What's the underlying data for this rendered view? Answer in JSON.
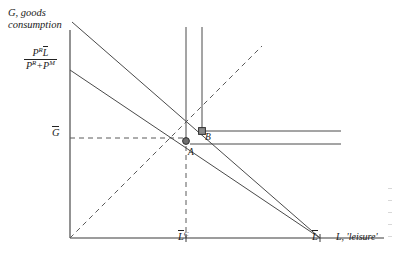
{
  "figure": {
    "type": "economics-diagram",
    "axes": {
      "y_label": "G, goods consumption",
      "y_label_line1": "G, goods",
      "y_label_line2": "consumption",
      "x_label": "L, 'leisure'",
      "origin": {
        "x": 70,
        "y": 238
      },
      "x_axis_end": {
        "x": 384,
        "y": 238
      },
      "y_axis_top": {
        "x": 70,
        "y": 30
      }
    },
    "ticks": {
      "y": [
        {
          "id": "g-bar",
          "label": "G",
          "overbar": true,
          "x": 70,
          "y": 138
        },
        {
          "id": "pr-fraction",
          "label": "P^R Lbar / (P^R + P^M)",
          "x": 70,
          "y": 70
        }
      ],
      "x": [
        {
          "id": "l-c",
          "label": "L",
          "overbar": true,
          "superscript": "C",
          "x": 186,
          "y": 238
        },
        {
          "id": "l-bar",
          "label": "L",
          "overbar": true,
          "x": 320,
          "y": 238
        }
      ]
    },
    "fraction_label": {
      "numerator_base": "P",
      "numerator_sup": "R",
      "numerator_var": "L",
      "denominator_first_base": "P",
      "denominator_first_sup": "R",
      "denominator_plus": "+",
      "denominator_second_base": "P",
      "denominator_second_sup": "M"
    },
    "points": [
      {
        "id": "A",
        "label": "A",
        "x": 186,
        "y": 141,
        "marker": "filled-circle"
      },
      {
        "id": "B",
        "label": "B",
        "x": 202,
        "y": 131,
        "marker": "filled-square"
      }
    ],
    "lines": {
      "budget_outer": {
        "from": {
          "x": 72,
          "y": 22
        },
        "to": {
          "x": 320,
          "y": 238
        },
        "style": "solid"
      },
      "budget_inner": {
        "from": {
          "x": 70,
          "y": 70
        },
        "to": {
          "x": 320,
          "y": 238
        },
        "style": "solid"
      },
      "vertical_a": {
        "from": {
          "x": 186,
          "y": 28
        },
        "to": {
          "x": 186,
          "y": 142
        },
        "style": "solid"
      },
      "vertical_b": {
        "from": {
          "x": 202,
          "y": 28
        },
        "to": {
          "x": 202,
          "y": 132
        },
        "style": "solid"
      },
      "horizontal_upper": {
        "from": {
          "x": 202,
          "y": 131
        },
        "to": {
          "x": 341,
          "y": 131
        },
        "style": "solid"
      },
      "horizontal_lower": {
        "from": {
          "x": 190,
          "y": 144
        },
        "to": {
          "x": 341,
          "y": 144
        },
        "style": "solid"
      },
      "diagonal_45": {
        "from": {
          "x": 70,
          "y": 238
        },
        "to": {
          "x": 262,
          "y": 46
        },
        "style": "dashed"
      },
      "guide_g_bar": {
        "from": {
          "x": 70,
          "y": 138
        },
        "to": {
          "x": 186,
          "y": 138
        },
        "style": "dashed"
      },
      "guide_l_c": {
        "from": {
          "x": 186,
          "y": 145
        },
        "to": {
          "x": 186,
          "y": 238
        },
        "style": "dashed"
      }
    },
    "colors": {
      "ink": "#2a2a2a",
      "line": "#4a4a4a",
      "background": "#ffffff",
      "marker": "#555555"
    }
  }
}
